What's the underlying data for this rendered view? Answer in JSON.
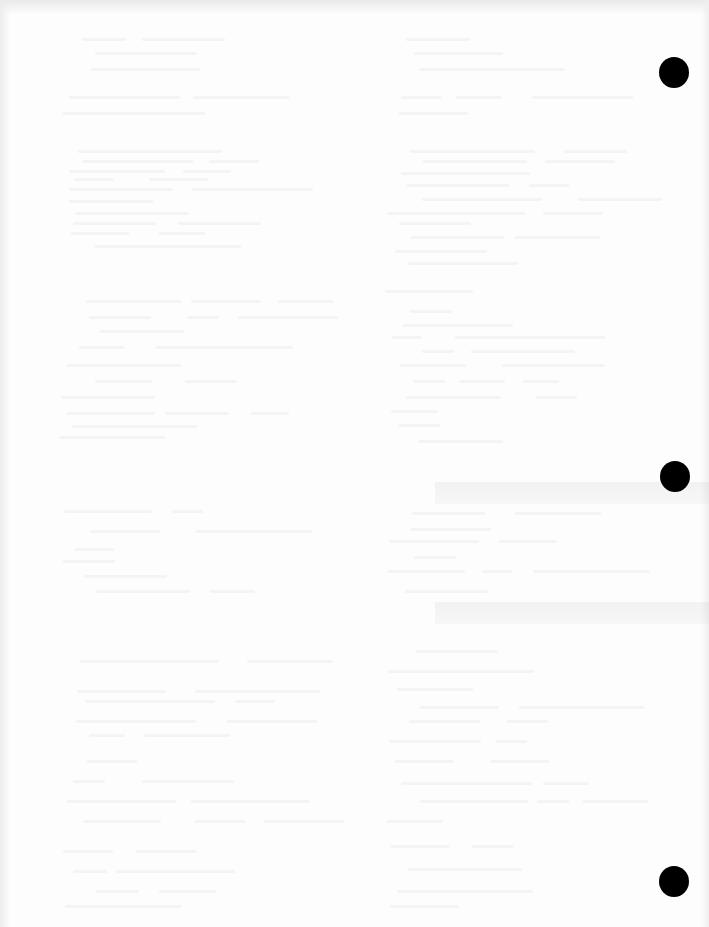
{
  "document": {
    "type": "scanned-blank-page",
    "background_color": "#fdfdfd",
    "bleed_through_opacity": 0.035
  },
  "punch_holes": [
    {
      "cx": 674,
      "cy": 72,
      "r": 15,
      "color": "#000000"
    },
    {
      "cx": 675,
      "cy": 476,
      "r": 15,
      "color": "#000000"
    },
    {
      "cx": 674,
      "cy": 881,
      "r": 15,
      "color": "#000000"
    }
  ],
  "bleed_bands": [
    {
      "x": 435,
      "y": 482,
      "w": 274,
      "h": 22
    },
    {
      "x": 435,
      "y": 602,
      "w": 274,
      "h": 22
    }
  ],
  "bleed_columns": [
    {
      "x": 60,
      "w": 290,
      "lines_y": [
        38,
        52,
        68,
        96,
        112,
        150,
        160,
        170,
        178,
        188,
        200,
        212,
        222,
        232,
        245,
        300,
        316,
        330,
        346,
        364,
        380,
        396,
        412,
        425,
        436,
        510,
        530,
        548,
        560,
        575,
        590,
        660,
        690,
        700,
        720,
        734,
        760,
        780,
        800,
        820,
        850,
        870,
        890,
        905
      ]
    },
    {
      "x": 385,
      "w": 290,
      "lines_y": [
        38,
        52,
        68,
        96,
        112,
        150,
        160,
        172,
        184,
        198,
        212,
        222,
        236,
        250,
        262,
        290,
        310,
        324,
        336,
        350,
        364,
        380,
        396,
        410,
        424,
        440,
        512,
        528,
        540,
        556,
        570,
        590,
        650,
        670,
        688,
        706,
        720,
        740,
        760,
        782,
        800,
        820,
        845,
        868,
        890,
        905
      ]
    }
  ]
}
